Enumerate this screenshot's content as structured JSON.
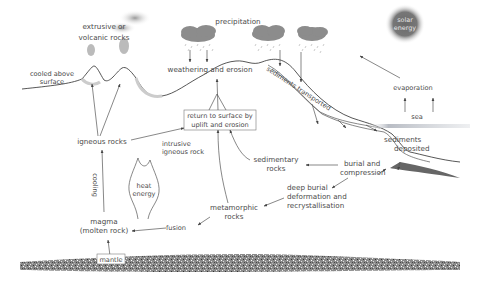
{
  "diagram": {
    "labels": {
      "extrusive": [
        "extrusive or",
        "volcanic rocks"
      ],
      "cooled_above": [
        "cooled above",
        "surface"
      ],
      "precipitation": "precipitation",
      "solar_energy": [
        "solar",
        "energy"
      ],
      "weathering": "weathering and erosion",
      "sediments_transported": "sediments transported",
      "evaporation": "evaporation",
      "sea": "sea",
      "return_to_surface": [
        "return to surface by",
        "uplift and erosion"
      ],
      "igneous_rocks": "igneous rocks",
      "intrusive": [
        "intrusive",
        "igneous rock"
      ],
      "sediments_deposited": [
        "sediments",
        "deposited"
      ],
      "sedimentary_rocks": [
        "sedimentary",
        "rocks"
      ],
      "burial": [
        "burial and",
        "compression"
      ],
      "heat_energy": [
        "heat",
        "energy"
      ],
      "cooling": "cooling",
      "deep_burial": [
        "deep burial",
        "deformation and",
        "recrystallisation"
      ],
      "metamorphic": [
        "metamorphic",
        "rocks"
      ],
      "magma": [
        "magma",
        "(molten rock)"
      ],
      "fusion": "fusion",
      "mantle": "mantle"
    },
    "colors": {
      "line": "#444444",
      "text": "#4a4a4a",
      "cloud": "#8a8a8a",
      "sun": "#6e6e6e",
      "mantle": "#7a7a7a",
      "sea": "#b8bcc4"
    }
  }
}
